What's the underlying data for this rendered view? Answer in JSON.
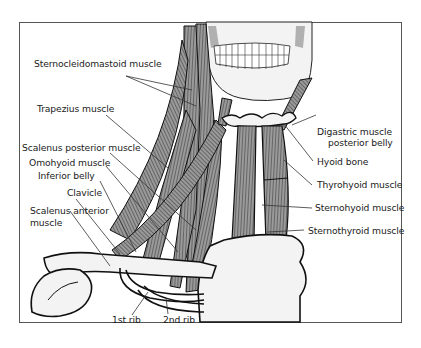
{
  "figure": {
    "labels_left": [
      {
        "id": "sternocleidomastoid",
        "text": "Sternocleidomastoid muscle"
      },
      {
        "id": "trapezius",
        "text": "Trapezius muscle"
      },
      {
        "id": "scalenus_posterior",
        "text": "Scalenus posterior muscle"
      },
      {
        "id": "omohyoid",
        "text": "Omohyoid muscle"
      },
      {
        "id": "inferior_belly",
        "text": "Inferior belly"
      },
      {
        "id": "clavicle",
        "text": "Clavicle"
      },
      {
        "id": "scalenus_anterior_1",
        "text": "Scalenus anterior"
      },
      {
        "id": "scalenus_anterior_2",
        "text": "muscle"
      }
    ],
    "labels_right": [
      {
        "id": "digastric_1",
        "text": "Digastric muscle"
      },
      {
        "id": "digastric_2",
        "text": "posterior belly"
      },
      {
        "id": "hyoid",
        "text": "Hyoid bone"
      },
      {
        "id": "thyrohyoid",
        "text": "Thyrohyoid muscle"
      },
      {
        "id": "sternohyoid",
        "text": "Sternohyoid muscle"
      },
      {
        "id": "sternothyroid",
        "text": "Sternothyroid muscle"
      }
    ],
    "labels_bottom": [
      {
        "id": "rib1",
        "text": "1st rib"
      },
      {
        "id": "rib2",
        "text": "2nd rib"
      }
    ],
    "colors": {
      "muscle": "#8a8a8a",
      "outline": "#111111",
      "bone": "#f2f2f2",
      "leader": "#333333",
      "shade": "#b5b5b5"
    }
  }
}
